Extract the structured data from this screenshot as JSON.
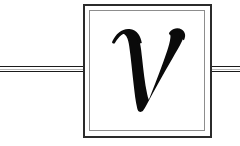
{
  "figure": {
    "kind": "circuit-element-symbol",
    "title": "Two-terminal box element labelled v",
    "background_color": "#ffffff",
    "canvas": {
      "width": 240,
      "height": 146
    }
  },
  "symbol": {
    "name": "boxed-element",
    "label": "v",
    "label_style": "italic-serif",
    "label_color": "#0a0a0a",
    "box": {
      "outer": {
        "x": 83,
        "y": 4,
        "width": 128,
        "height": 133
      },
      "inner": {
        "x": 89,
        "y": 10,
        "width": 116,
        "height": 121
      },
      "outer_color": "#2b2b2b",
      "inner_color": "#8d8d8d",
      "fill_color": "#ffffff"
    }
  },
  "leads": {
    "color": "#1b1b1b",
    "highlight_color": "#9a9a9a",
    "y_center": 69,
    "left": {
      "name": "left-terminal-lead",
      "x_start": 0,
      "x_end": 84
    },
    "right": {
      "name": "right-terminal-lead",
      "x_start": 210,
      "x_end": 240
    }
  }
}
